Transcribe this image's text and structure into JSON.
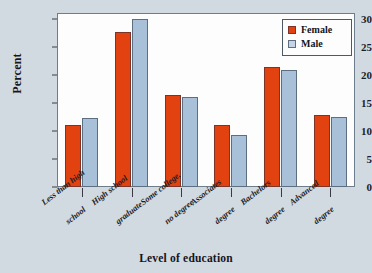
{
  "chart_data": {
    "type": "bar",
    "title": "",
    "xlabel": "Level of education",
    "ylabel": "Percent",
    "ylim": [
      0,
      31
    ],
    "yticks": [
      0,
      5,
      10,
      15,
      20,
      25,
      30
    ],
    "grid": false,
    "legend_position": "top-right",
    "categories": [
      "Less than high|school",
      "High school|graduate",
      "Some college,|no degree",
      "Associates|degree",
      "Bachelors|degree",
      "Advanced|degree"
    ],
    "category_lines": [
      [
        "Less than high",
        "school"
      ],
      [
        "High school",
        "graduate"
      ],
      [
        "Some college,",
        "no degree"
      ],
      [
        "Associates",
        "degree"
      ],
      [
        "Bachelors",
        "degree"
      ],
      [
        "Advanced",
        "degree"
      ]
    ],
    "series": [
      {
        "name": "Female",
        "color": "#e2420f",
        "values": [
          11.0,
          27.7,
          16.4,
          11.1,
          21.4,
          12.8
        ]
      },
      {
        "name": "Male",
        "color": "#a9c1d8",
        "values": [
          12.3,
          29.9,
          16.1,
          9.2,
          20.9,
          12.5
        ]
      }
    ]
  },
  "legend": {
    "items": [
      {
        "label": "Female",
        "swatch": "female"
      },
      {
        "label": "Male",
        "swatch": "male"
      }
    ]
  }
}
